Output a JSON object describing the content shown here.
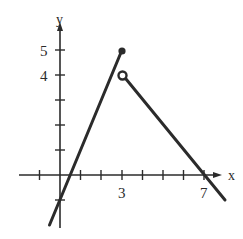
{
  "figure": {
    "type": "piecewise-function-graph",
    "axis_labels": {
      "x": "x",
      "y": "y"
    },
    "x_tick_labels": [
      {
        "value": 3,
        "label": "3"
      },
      {
        "value": 7,
        "label": "7"
      }
    ],
    "y_tick_labels": [
      {
        "value": 4,
        "label": "4"
      },
      {
        "value": 5,
        "label": "5"
      }
    ],
    "x_ticks": [
      -1,
      1,
      2,
      3,
      4,
      5,
      6,
      7
    ],
    "y_ticks": [
      -1,
      1,
      2,
      3,
      4,
      5
    ],
    "segments": [
      {
        "name": "left-piece",
        "from": [
          -0.5,
          -2
        ],
        "to": [
          3,
          5
        ],
        "slope": 2,
        "y_intercept": -1
      },
      {
        "name": "right-piece",
        "from": [
          3,
          4
        ],
        "to": [
          8,
          -1
        ],
        "slope": -1,
        "x_intercept": 7
      }
    ],
    "points": [
      {
        "name": "closed-endpoint",
        "x": 3,
        "y": 5,
        "filled": true
      },
      {
        "name": "open-endpoint",
        "x": 3,
        "y": 4,
        "filled": false
      }
    ],
    "colors": {
      "ink": "#2b2b2b",
      "background": "#ffffff"
    }
  }
}
